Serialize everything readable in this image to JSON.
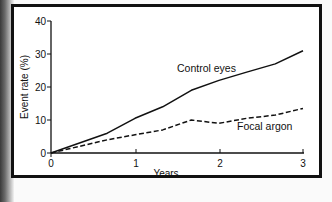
{
  "chart_data": {
    "type": "line",
    "title": "",
    "xlabel": "Years",
    "ylabel": "Event rate (%)",
    "xlim": [
      0,
      3
    ],
    "ylim": [
      0,
      40
    ],
    "x_ticks": [
      "0",
      "1",
      "2",
      "3"
    ],
    "y_ticks": [
      "0",
      "10",
      "20",
      "30",
      "40"
    ],
    "grid": false,
    "legend": "inline labels",
    "x": [
      0,
      0.67,
      1,
      1.33,
      1.67,
      2,
      2.33,
      2.67,
      3
    ],
    "series": [
      {
        "name": "Control eyes",
        "style": "solid",
        "values": [
          0,
          6,
          10.5,
          14,
          19,
          22,
          24.5,
          27,
          31
        ]
      },
      {
        "name": "Focal argon",
        "style": "dashed",
        "values": [
          0,
          4,
          5.5,
          7,
          10,
          9,
          10.5,
          11.5,
          13.5
        ]
      }
    ]
  },
  "labels": {
    "xlabel": "Years",
    "ylabel": "Event rate (%)",
    "series_control": "Control eyes",
    "series_focal": "Focal argon",
    "x_ticks": [
      "0",
      "1",
      "2",
      "3"
    ],
    "y_ticks": [
      "0",
      "10",
      "20",
      "30",
      "40"
    ]
  }
}
